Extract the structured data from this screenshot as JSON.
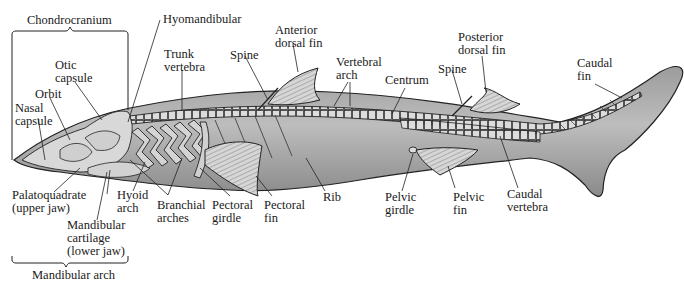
{
  "diagram": {
    "colors": {
      "background": "#ffffff",
      "body_fill": "#b4b4b4",
      "body_dark": "#8e8e8e",
      "cartilage_fill": "#d9d9d9",
      "line": "#222222",
      "text": "#1a1a1a"
    },
    "brackets": {
      "top": {
        "label": "Chondrocranium"
      },
      "bottom": {
        "label": "Mandibular arch"
      }
    },
    "labels": [
      {
        "id": "chondrocranium",
        "lines": [
          "Chondrocranium"
        ]
      },
      {
        "id": "hyomandibular",
        "lines": [
          "Hyomandibular"
        ]
      },
      {
        "id": "otic-capsule",
        "lines": [
          "Otic",
          "capsule"
        ]
      },
      {
        "id": "orbit",
        "lines": [
          "Orbit"
        ]
      },
      {
        "id": "nasal-capsule",
        "lines": [
          "Nasal",
          "capsule"
        ]
      },
      {
        "id": "trunk-vertebra",
        "lines": [
          "Trunk",
          "vertebra"
        ]
      },
      {
        "id": "spine-anterior",
        "lines": [
          "Spine"
        ]
      },
      {
        "id": "anterior-dorsal-fin",
        "lines": [
          "Anterior",
          "dorsal fin"
        ]
      },
      {
        "id": "vertebral-arch",
        "lines": [
          "Vertebral",
          "arch"
        ]
      },
      {
        "id": "centrum",
        "lines": [
          "Centrum"
        ]
      },
      {
        "id": "spine-posterior",
        "lines": [
          "Spine"
        ]
      },
      {
        "id": "posterior-dorsal-fin",
        "lines": [
          "Posterior",
          "dorsal fin"
        ]
      },
      {
        "id": "caudal-fin",
        "lines": [
          "Caudal",
          "fin"
        ]
      },
      {
        "id": "palatoquadrate",
        "lines": [
          "Palatoquadrate",
          "(upper jaw)"
        ]
      },
      {
        "id": "hyoid-arch",
        "lines": [
          "Hyoid",
          "arch"
        ]
      },
      {
        "id": "mandibular-cartilage",
        "lines": [
          "Mandibular",
          "cartilage",
          "(lower jaw)"
        ]
      },
      {
        "id": "branchial-arches",
        "lines": [
          "Branchial",
          "arches"
        ]
      },
      {
        "id": "pectoral-girdle",
        "lines": [
          "Pectoral",
          "girdle"
        ]
      },
      {
        "id": "pectoral-fin",
        "lines": [
          "Pectoral",
          "fin"
        ]
      },
      {
        "id": "rib",
        "lines": [
          "Rib"
        ]
      },
      {
        "id": "pelvic-girdle",
        "lines": [
          "Pelvic",
          "girdle"
        ]
      },
      {
        "id": "pelvic-fin",
        "lines": [
          "Pelvic",
          "fin"
        ]
      },
      {
        "id": "caudal-vertebra",
        "lines": [
          "Caudal",
          "vertebra"
        ]
      },
      {
        "id": "mandibular-arch",
        "lines": [
          "Mandibular arch"
        ]
      }
    ]
  }
}
